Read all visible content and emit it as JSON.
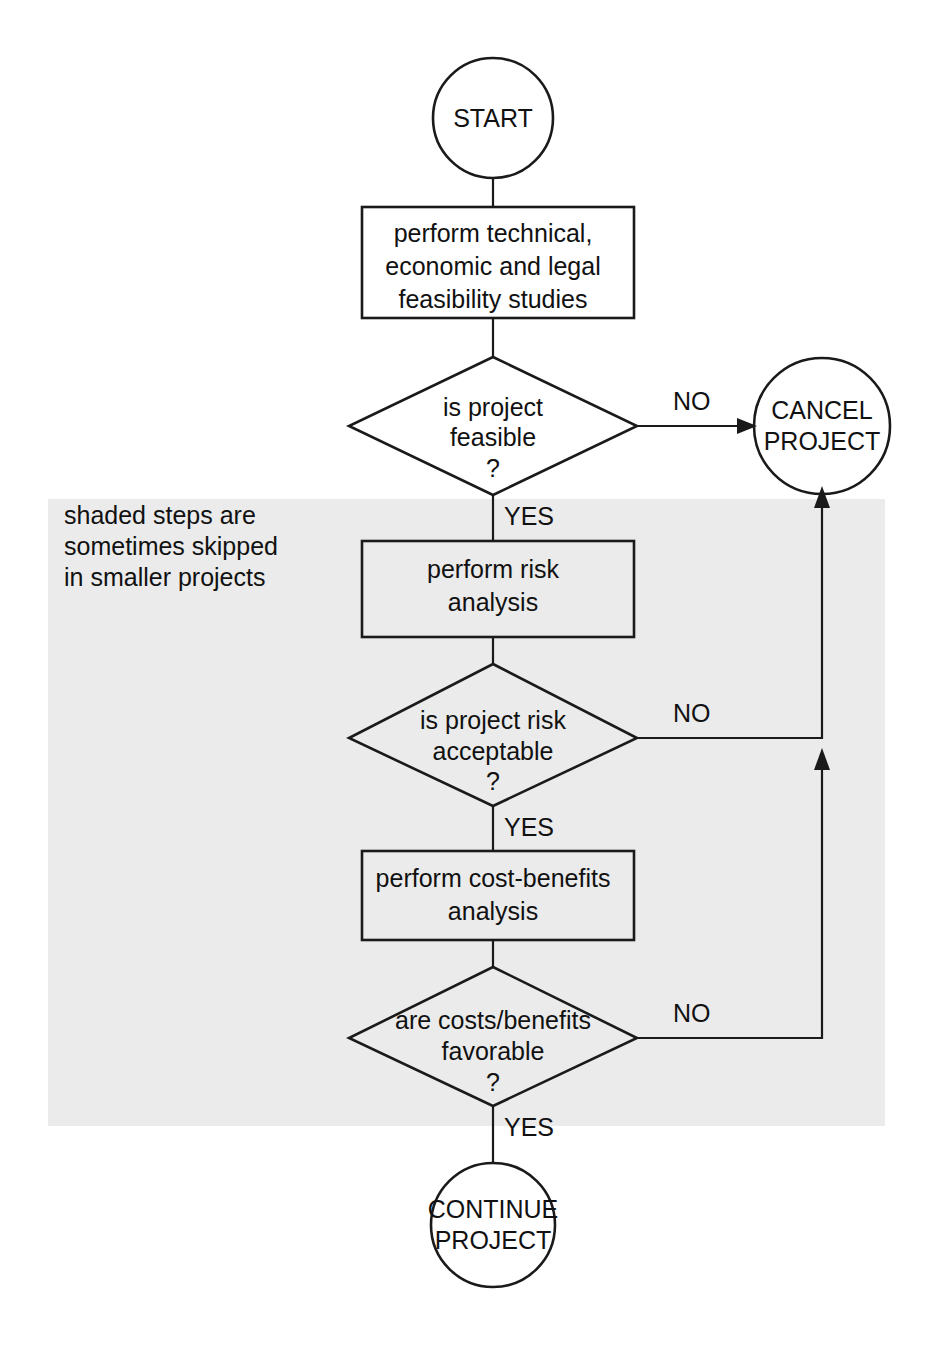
{
  "diagram": {
    "background_color": "#ffffff",
    "line_color": "#1a1a1a",
    "shaded_region_color": "#ebebeb",
    "note": {
      "line1": "shaded steps are",
      "line2": "sometimes skipped",
      "line3": "in smaller projects"
    },
    "terminators": [
      {
        "id": "start",
        "label": "START",
        "lines": [
          "START"
        ]
      },
      {
        "id": "cancel",
        "label": "CANCEL PROJECT",
        "lines": [
          "CANCEL",
          "PROJECT"
        ]
      },
      {
        "id": "continue",
        "label": "CONTINUE PROJECT",
        "lines": [
          "CONTINUE",
          "PROJECT"
        ]
      }
    ],
    "processes": [
      {
        "id": "feasibility-studies",
        "label": "perform technical, economic and legal feasibility studies",
        "lines": [
          "perform technical,",
          "economic and legal",
          "feasibility studies"
        ],
        "shaded": false
      },
      {
        "id": "risk-analysis",
        "label": "perform risk analysis",
        "lines": [
          "perform risk",
          "analysis"
        ],
        "shaded": true
      },
      {
        "id": "cost-benefits-analysis",
        "label": "perform cost-benefits analysis",
        "lines": [
          "perform cost-benefits",
          "analysis"
        ],
        "shaded": true
      }
    ],
    "decisions": [
      {
        "id": "is-project-feasible",
        "label": "is project feasible ?",
        "lines": [
          "is project",
          "feasible",
          "?"
        ],
        "yes_label": "YES",
        "no_label": "NO"
      },
      {
        "id": "is-project-risk-acceptable",
        "label": "is project risk acceptable ?",
        "lines": [
          "is project risk",
          "acceptable",
          "?"
        ],
        "yes_label": "YES",
        "no_label": "NO"
      },
      {
        "id": "are-costs-benefits-favorable",
        "label": "are costs/benefits favorable ?",
        "lines": [
          "are costs/benefits",
          "favorable",
          "?"
        ],
        "yes_label": "YES",
        "no_label": "NO"
      }
    ],
    "edge_labels": {
      "no1": "NO",
      "no2": "NO",
      "no3": "NO",
      "yes1": "YES",
      "yes2": "YES",
      "yes3": "YES"
    }
  }
}
